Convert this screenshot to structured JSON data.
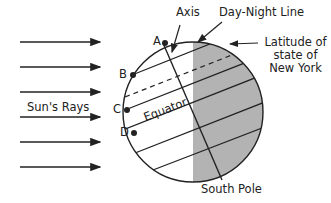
{
  "diagram": {
    "labels": {
      "axis": "Axis",
      "day_night_line": "Day-Night Line",
      "latitude_line1": "Latitude of",
      "latitude_line2": "state of",
      "latitude_line3": "New York",
      "suns_rays": "Sun's Rays",
      "equator": "Equator",
      "south_pole": "South Pole"
    },
    "points": [
      "A",
      "B",
      "C",
      "D"
    ],
    "colors": {
      "night_shade": "#b3b3b3",
      "line": "#222222",
      "background": "#ffffff"
    }
  }
}
